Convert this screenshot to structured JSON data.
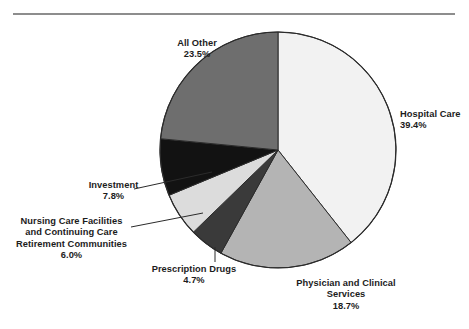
{
  "chart_data": {
    "type": "pie",
    "title": "",
    "subtitle": "",
    "xlabel": "",
    "ylabel": "",
    "legend_position": "none",
    "grid": false,
    "units": "percent",
    "start_angle_deg": 0,
    "direction": "clockwise",
    "categories": [
      "Hospital Care",
      "Physician and Clinical Services",
      "Prescription Drugs",
      "Nursing Care Facilities and Continuing Care Retirement Communities",
      "Investment",
      "All Other"
    ],
    "values": [
      39.4,
      18.7,
      4.7,
      6.0,
      7.8,
      23.5
    ],
    "colors": [
      "#f2f2f2",
      "#b4b4b4",
      "#3a3a3a",
      "#dcdcdc",
      "#121212",
      "#6e6e6e"
    ],
    "slices": [
      {
        "name": "Hospital Care",
        "value": 39.4,
        "value_label": "39.4%",
        "color": "#f2f2f2",
        "label_lines": [
          "Hospital Care"
        ]
      },
      {
        "name": "Physician and Clinical Services",
        "value": 18.7,
        "value_label": "18.7%",
        "color": "#b4b4b4",
        "label_lines": [
          "Physician and Clinical",
          "Services"
        ]
      },
      {
        "name": "Prescription Drugs",
        "value": 4.7,
        "value_label": "4.7%",
        "color": "#3a3a3a",
        "label_lines": [
          "Prescription Drugs"
        ]
      },
      {
        "name": "Nursing Care Facilities and Continuing Care Retirement Communities",
        "value": 6.0,
        "value_label": "6.0%",
        "color": "#dcdcdc",
        "label_lines": [
          "Nursing Care Facilities",
          "and Continuing Care",
          "Retirement Communities"
        ]
      },
      {
        "name": "Investment",
        "value": 7.8,
        "value_label": "7.8%",
        "color": "#121212",
        "label_lines": [
          "Investment"
        ]
      },
      {
        "name": "All Other",
        "value": 23.5,
        "value_label": "23.5%",
        "color": "#6e6e6e",
        "label_lines": [
          "All Other"
        ]
      }
    ]
  },
  "labels": {
    "hospital": {
      "line1": "Hospital Care",
      "pct": "39.4%"
    },
    "physician": {
      "line1": "Physician and Clinical",
      "line2": "Services",
      "pct": "18.7%"
    },
    "prescription": {
      "line1": "Prescription Drugs",
      "pct": "4.7%"
    },
    "nursing": {
      "line1": "Nursing Care Facilities",
      "line2": "and Continuing Care",
      "line3": "Retirement Communities",
      "pct": "6.0%"
    },
    "investment": {
      "line1": "Investment",
      "pct": "7.8%"
    },
    "allother": {
      "line1": "All Other",
      "pct": "23.5%"
    }
  },
  "style": {
    "rule_color": "#8d8d8d",
    "outline_color": "#2b2b2b",
    "leader_color": "#2b2b2b",
    "background": "#ffffff",
    "text_color": "#1c1c1c"
  }
}
